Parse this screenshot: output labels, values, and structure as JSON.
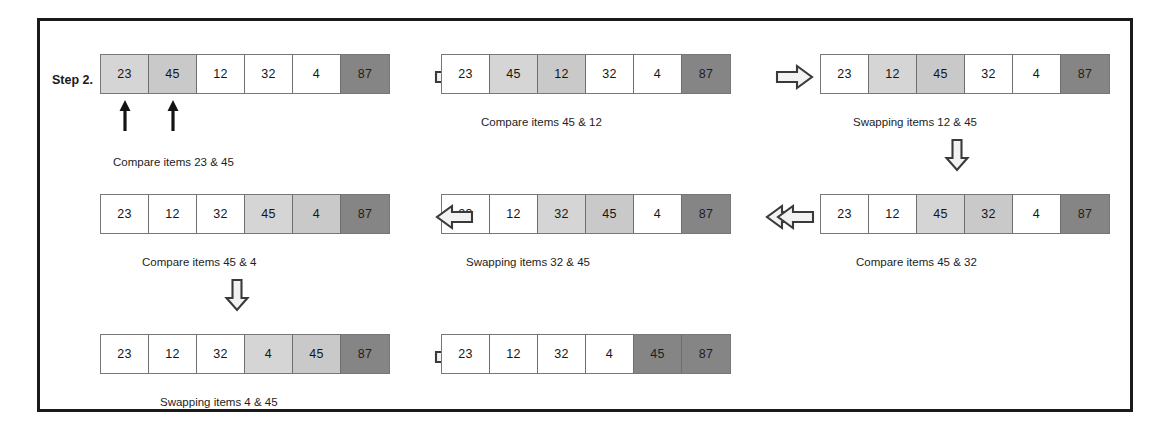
{
  "diagram": {
    "step_label": "Step 2.",
    "colors": {
      "frame_border": "#1a1a1a",
      "cell_active": "#d5d5d5",
      "cell_sorted": "#858585",
      "cell_plain": "#ffffff",
      "text": "#161616"
    }
  },
  "panels": [
    {
      "id": "panel-1",
      "values": [
        "23",
        "45",
        "12",
        "32",
        "4",
        "87"
      ],
      "states": [
        "active",
        "active2",
        "plain",
        "plain",
        "plain",
        "sorted"
      ],
      "caption": "Compare items 23 & 45",
      "pointers": [
        0,
        1
      ],
      "flow_arrow": "arrow-right-icon",
      "down_arrow": false
    },
    {
      "id": "panel-2",
      "values": [
        "23",
        "45",
        "12",
        "32",
        "4",
        "87"
      ],
      "states": [
        "plain",
        "active",
        "active2",
        "plain",
        "plain",
        "sorted"
      ],
      "caption": "Compare items 45 & 12",
      "pointers": [],
      "flow_arrow": "arrow-right-icon",
      "down_arrow": false
    },
    {
      "id": "panel-3",
      "values": [
        "23",
        "12",
        "45",
        "32",
        "4",
        "87"
      ],
      "states": [
        "plain",
        "active",
        "active2",
        "plain",
        "plain",
        "sorted"
      ],
      "caption": "Swapping items 12 & 45",
      "pointers": [],
      "flow_arrow": null,
      "down_arrow": true
    },
    {
      "id": "panel-4",
      "values": [
        "23",
        "12",
        "45",
        "32",
        "4",
        "87"
      ],
      "states": [
        "plain",
        "plain",
        "active",
        "active2",
        "plain",
        "sorted"
      ],
      "caption": "Compare items 45 & 32",
      "pointers": [],
      "flow_arrow": "arrow-left-icon",
      "down_arrow": false
    },
    {
      "id": "panel-5",
      "values": [
        "23",
        "12",
        "32",
        "45",
        "4",
        "87"
      ],
      "states": [
        "plain",
        "plain",
        "active",
        "active2",
        "plain",
        "sorted"
      ],
      "caption": "Swapping items 32 & 45",
      "pointers": [],
      "flow_arrow": "arrow-left-icon",
      "down_arrow": false
    },
    {
      "id": "panel-6",
      "values": [
        "23",
        "12",
        "32",
        "45",
        "4",
        "87"
      ],
      "states": [
        "plain",
        "plain",
        "plain",
        "active",
        "active2",
        "sorted"
      ],
      "caption": "Compare items 45 & 4",
      "pointers": [],
      "flow_arrow": null,
      "down_arrow": true
    },
    {
      "id": "panel-7",
      "values": [
        "23",
        "12",
        "32",
        "4",
        "45",
        "87"
      ],
      "states": [
        "plain",
        "plain",
        "plain",
        "active",
        "active2",
        "sorted"
      ],
      "caption": "Swapping items 4 & 45",
      "pointers": [],
      "flow_arrow": "arrow-right-icon",
      "down_arrow": false
    },
    {
      "id": "panel-8",
      "values": [
        "23",
        "12",
        "32",
        "4",
        "45",
        "87"
      ],
      "states": [
        "plain",
        "plain",
        "plain",
        "plain",
        "sorted",
        "sorted"
      ],
      "caption": "",
      "pointers": [],
      "flow_arrow": null,
      "down_arrow": false
    }
  ]
}
